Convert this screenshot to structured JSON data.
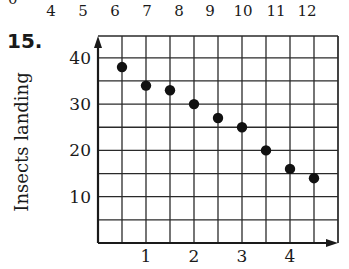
{
  "header_row": {
    "partial_label": "0",
    "numbers": [
      "4",
      "5",
      "6",
      "7",
      "8",
      "9",
      "10",
      "11",
      "12"
    ]
  },
  "problem": {
    "number": "15."
  },
  "chart_data": {
    "type": "scatter",
    "title": "",
    "xlabel": "",
    "ylabel": "Insects landing",
    "x_tick_labels": [
      "1",
      "2",
      "3",
      "4"
    ],
    "x_ticks": [
      1,
      2,
      3,
      4
    ],
    "y_tick_labels": [
      "10",
      "20",
      "30",
      "40"
    ],
    "y_ticks": [
      10,
      20,
      30,
      40
    ],
    "xlim": [
      0,
      5
    ],
    "ylim": [
      0,
      45
    ],
    "grid": true,
    "grid_x_step": 0.5,
    "grid_y_step": 5,
    "legend": null,
    "series": [
      {
        "name": "Insects landing",
        "x": [
          0.5,
          1.0,
          1.5,
          2.0,
          2.5,
          3.0,
          3.5,
          4.0,
          4.5
        ],
        "y": [
          38,
          34,
          33,
          30,
          27,
          25,
          20,
          16,
          14
        ]
      }
    ]
  }
}
